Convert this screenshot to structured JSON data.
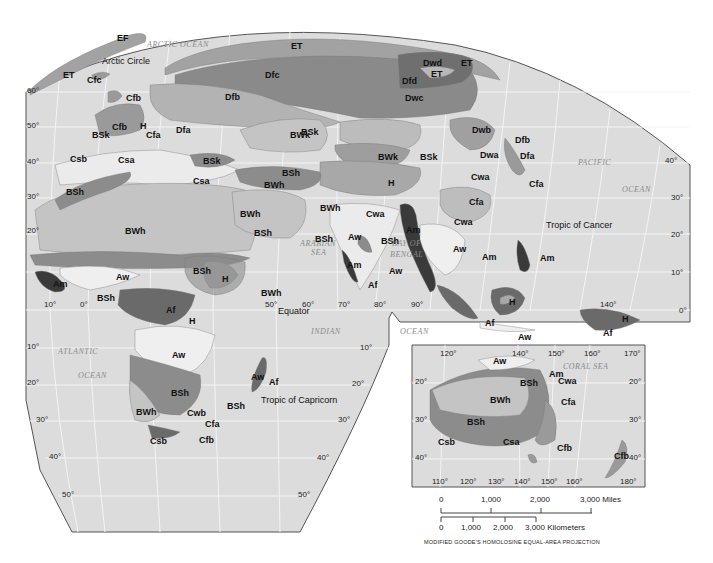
{
  "map": {
    "projection_note": "MODIFIED GOODE'S HOMOLOSINE EQUAL-AREA PROJECTION",
    "colors": {
      "ocean": "#dcdcdc",
      "grid": "#f4f4f4",
      "outline": "#555555",
      "tropical_wet_Af": "#6a6a6a",
      "tropical_monsoon_Am": "#3a3a3a",
      "savanna_Aw": "#efefef",
      "desert_BW": "#c4c4c4",
      "steppe_BS": "#8c8c8c",
      "mediterranean_Cs": "#ebebeb",
      "humid_subtropical_Cfa": "#bdbdbd",
      "marine_Cfb": "#9a9a9a",
      "continental_Dfb": "#b3b3b3",
      "subarctic_Dfc": "#8a8a8a",
      "tundra_ET": "#a2a2a2",
      "highland_H": "#a8a8a8"
    },
    "oceans": [
      {
        "id": "arctic",
        "label": "ARCTIC OCEAN",
        "x": 147,
        "y": 46
      },
      {
        "id": "pacific",
        "label": "PACIFIC",
        "x": 578,
        "y": 164
      },
      {
        "id": "pacific2",
        "label": "OCEAN",
        "x": 622,
        "y": 191
      },
      {
        "id": "arabian",
        "label": "ARABIAN",
        "x": 300,
        "y": 245
      },
      {
        "id": "arabian2",
        "label": "SEA",
        "x": 311,
        "y": 254
      },
      {
        "id": "bengal",
        "label": "BAY OF",
        "x": 392,
        "y": 245
      },
      {
        "id": "bengal2",
        "label": "BENGAL",
        "x": 390,
        "y": 256
      },
      {
        "id": "indian",
        "label": "INDIAN",
        "x": 311,
        "y": 333
      },
      {
        "id": "indian2",
        "label": "OCEAN",
        "x": 400,
        "y": 333
      },
      {
        "id": "atlantic",
        "label": "ATLANTIC",
        "x": 58,
        "y": 353
      },
      {
        "id": "atlantic2",
        "label": "OCEAN",
        "x": 78,
        "y": 377
      },
      {
        "id": "coral",
        "label": "CORAL SEA",
        "x": 563,
        "y": 368
      }
    ],
    "features": [
      {
        "id": "arctic-circle",
        "label": "Arctic Circle",
        "x": 102,
        "y": 62
      },
      {
        "id": "equator",
        "label": "Equator",
        "x": 278,
        "y": 312
      },
      {
        "id": "tropic-cancer",
        "label": "Tropic of Cancer",
        "x": 546,
        "y": 226
      },
      {
        "id": "tropic-capricorn",
        "label": "Tropic of Capricorn",
        "x": 261,
        "y": 401
      }
    ],
    "climate_labels": [
      {
        "t": "EF",
        "x": 117,
        "y": 39
      },
      {
        "t": "ET",
        "x": 63,
        "y": 76
      },
      {
        "t": "Cfc",
        "x": 87,
        "y": 81
      },
      {
        "t": "ET",
        "x": 291,
        "y": 47
      },
      {
        "t": "Dfc",
        "x": 265,
        "y": 76
      },
      {
        "t": "Dwd",
        "x": 423,
        "y": 64
      },
      {
        "t": "ET",
        "x": 461,
        "y": 64
      },
      {
        "t": "ET",
        "x": 431,
        "y": 75
      },
      {
        "t": "Dfd",
        "x": 402,
        "y": 82
      },
      {
        "t": "Dwc",
        "x": 405,
        "y": 99
      },
      {
        "t": "Dfb",
        "x": 225,
        "y": 98
      },
      {
        "t": "Cfb",
        "x": 126,
        "y": 99
      },
      {
        "t": "Cfb",
        "x": 112,
        "y": 128
      },
      {
        "t": "H",
        "x": 140,
        "y": 127
      },
      {
        "t": "Cfa",
        "x": 146,
        "y": 136
      },
      {
        "t": "Dfa",
        "x": 176,
        "y": 131
      },
      {
        "t": "BSk",
        "x": 92,
        "y": 136
      },
      {
        "t": "Csb",
        "x": 70,
        "y": 160
      },
      {
        "t": "Csa",
        "x": 118,
        "y": 161
      },
      {
        "t": "BSk",
        "x": 301,
        "y": 133
      },
      {
        "t": "BWk",
        "x": 290,
        "y": 136
      },
      {
        "t": "BWk",
        "x": 378,
        "y": 158
      },
      {
        "t": "BSk",
        "x": 420,
        "y": 158
      },
      {
        "t": "Dwb",
        "x": 472,
        "y": 131
      },
      {
        "t": "Dfb",
        "x": 515,
        "y": 141
      },
      {
        "t": "Dwa",
        "x": 480,
        "y": 156
      },
      {
        "t": "Dfa",
        "x": 520,
        "y": 157
      },
      {
        "t": "BSk",
        "x": 203,
        "y": 162
      },
      {
        "t": "Csa",
        "x": 193,
        "y": 182
      },
      {
        "t": "BSh",
        "x": 66,
        "y": 193
      },
      {
        "t": "BSh",
        "x": 282,
        "y": 174
      },
      {
        "t": "BWh",
        "x": 264,
        "y": 186
      },
      {
        "t": "H",
        "x": 388,
        "y": 184
      },
      {
        "t": "Cwa",
        "x": 471,
        "y": 178
      },
      {
        "t": "Cfa",
        "x": 529,
        "y": 185
      },
      {
        "t": "Cfa",
        "x": 469,
        "y": 203
      },
      {
        "t": "BWh",
        "x": 240,
        "y": 215
      },
      {
        "t": "BWh",
        "x": 320,
        "y": 209
      },
      {
        "t": "Cwa",
        "x": 366,
        "y": 215
      },
      {
        "t": "Cwa",
        "x": 454,
        "y": 223
      },
      {
        "t": "BWh",
        "x": 125,
        "y": 232
      },
      {
        "t": "BSh",
        "x": 254,
        "y": 234
      },
      {
        "t": "BSh",
        "x": 315,
        "y": 240
      },
      {
        "t": "Aw",
        "x": 348,
        "y": 238
      },
      {
        "t": "BSh",
        "x": 381,
        "y": 242
      },
      {
        "t": "Am",
        "x": 406,
        "y": 231
      },
      {
        "t": "Aw",
        "x": 453,
        "y": 250
      },
      {
        "t": "Am",
        "x": 482,
        "y": 258
      },
      {
        "t": "Am",
        "x": 540,
        "y": 259
      },
      {
        "t": "Am",
        "x": 347,
        "y": 266
      },
      {
        "t": "Aw",
        "x": 389,
        "y": 272
      },
      {
        "t": "Af",
        "x": 368,
        "y": 286
      },
      {
        "t": "BSh",
        "x": 193,
        "y": 272
      },
      {
        "t": "H",
        "x": 222,
        "y": 280
      },
      {
        "t": "Aw",
        "x": 116,
        "y": 278
      },
      {
        "t": "Am",
        "x": 53,
        "y": 285
      },
      {
        "t": "BSh",
        "x": 97,
        "y": 299
      },
      {
        "t": "BWh",
        "x": 261,
        "y": 294
      },
      {
        "t": "Af",
        "x": 166,
        "y": 311
      },
      {
        "t": "H",
        "x": 189,
        "y": 322
      },
      {
        "t": "H",
        "x": 509,
        "y": 303
      },
      {
        "t": "Af",
        "x": 485,
        "y": 324
      },
      {
        "t": "H",
        "x": 622,
        "y": 320
      },
      {
        "t": "Af",
        "x": 603,
        "y": 334
      },
      {
        "t": "Aw",
        "x": 518,
        "y": 338
      },
      {
        "t": "Aw",
        "x": 172,
        "y": 356
      },
      {
        "t": "Aw",
        "x": 251,
        "y": 378
      },
      {
        "t": "Af",
        "x": 269,
        "y": 383
      },
      {
        "t": "BSh",
        "x": 171,
        "y": 394
      },
      {
        "t": "BSh",
        "x": 227,
        "y": 407
      },
      {
        "t": "BWh",
        "x": 136,
        "y": 413
      },
      {
        "t": "Cwb",
        "x": 187,
        "y": 414
      },
      {
        "t": "Cfa",
        "x": 205,
        "y": 425
      },
      {
        "t": "Csb",
        "x": 150,
        "y": 442
      },
      {
        "t": "Cfb",
        "x": 199,
        "y": 441
      },
      {
        "t": "Aw",
        "x": 493,
        "y": 362
      },
      {
        "t": "Am",
        "x": 549,
        "y": 375
      },
      {
        "t": "BSh",
        "x": 520,
        "y": 384
      },
      {
        "t": "Cwa",
        "x": 558,
        "y": 382
      },
      {
        "t": "BWh",
        "x": 490,
        "y": 401
      },
      {
        "t": "Cfa",
        "x": 561,
        "y": 403
      },
      {
        "t": "BSh",
        "x": 467,
        "y": 423
      },
      {
        "t": "Csb",
        "x": 438,
        "y": 443
      },
      {
        "t": "Csa",
        "x": 503,
        "y": 443
      },
      {
        "t": "Cfb",
        "x": 557,
        "y": 449
      },
      {
        "t": "Cfb",
        "x": 614,
        "y": 457
      }
    ],
    "latitude_labels": [
      {
        "t": "60°",
        "x": 27,
        "y": 92
      },
      {
        "t": "50°",
        "x": 27,
        "y": 127
      },
      {
        "t": "40°",
        "x": 27,
        "y": 163
      },
      {
        "t": "30°",
        "x": 27,
        "y": 198
      },
      {
        "t": "20°",
        "x": 27,
        "y": 232
      },
      {
        "t": "10°",
        "x": 27,
        "y": 348
      },
      {
        "t": "20°",
        "x": 27,
        "y": 384
      },
      {
        "t": "30°",
        "x": 36,
        "y": 421
      },
      {
        "t": "40°",
        "x": 49,
        "y": 458
      },
      {
        "t": "50°",
        "x": 62,
        "y": 496
      },
      {
        "t": "40°",
        "x": 665,
        "y": 162
      },
      {
        "t": "30°",
        "x": 671,
        "y": 199
      },
      {
        "t": "20°",
        "x": 671,
        "y": 236
      },
      {
        "t": "10°",
        "x": 671,
        "y": 274
      },
      {
        "t": "0°",
        "x": 679,
        "y": 312
      },
      {
        "t": "10°",
        "x": 360,
        "y": 349
      },
      {
        "t": "20°",
        "x": 352,
        "y": 385
      },
      {
        "t": "30°",
        "x": 338,
        "y": 421
      },
      {
        "t": "40°",
        "x": 317,
        "y": 459
      },
      {
        "t": "50°",
        "x": 298,
        "y": 496
      }
    ],
    "longitude_labels": [
      {
        "t": "10°",
        "x": 44,
        "y": 306
      },
      {
        "t": "0°",
        "x": 80,
        "y": 306
      },
      {
        "t": "50°",
        "x": 265,
        "y": 306
      },
      {
        "t": "60°",
        "x": 302,
        "y": 306
      },
      {
        "t": "70°",
        "x": 338,
        "y": 306
      },
      {
        "t": "80°",
        "x": 374,
        "y": 306
      },
      {
        "t": "90°",
        "x": 411,
        "y": 306
      },
      {
        "t": "140°",
        "x": 600,
        "y": 306
      }
    ],
    "inset": {
      "top_labels": [
        {
          "t": "120°",
          "x": 440,
          "y": 355
        },
        {
          "t": "140°",
          "x": 512,
          "y": 355
        },
        {
          "t": "150°",
          "x": 548,
          "y": 355
        },
        {
          "t": "160°",
          "x": 584,
          "y": 355
        },
        {
          "t": "170°",
          "x": 624,
          "y": 355
        }
      ],
      "bottom_labels": [
        {
          "t": "110°",
          "x": 432,
          "y": 483
        },
        {
          "t": "120°",
          "x": 460,
          "y": 483
        },
        {
          "t": "130°",
          "x": 488,
          "y": 483
        },
        {
          "t": "140°",
          "x": 514,
          "y": 483
        },
        {
          "t": "150°",
          "x": 541,
          "y": 483
        },
        {
          "t": "160°",
          "x": 566,
          "y": 483
        },
        {
          "t": "180°",
          "x": 620,
          "y": 483
        }
      ],
      "left_labels": [
        {
          "t": "20°",
          "x": 415,
          "y": 383
        },
        {
          "t": "30°",
          "x": 415,
          "y": 421
        },
        {
          "t": "40°",
          "x": 415,
          "y": 459
        }
      ],
      "right_labels": [
        {
          "t": "20°",
          "x": 629,
          "y": 383
        },
        {
          "t": "30°",
          "x": 629,
          "y": 421
        },
        {
          "t": "40°",
          "x": 629,
          "y": 459
        }
      ]
    },
    "scale": {
      "miles": {
        "ticks": [
          "0",
          "1,000",
          "2,000",
          "3,000 Miles"
        ]
      },
      "km": {
        "ticks": [
          "0",
          "1,000",
          "2,000",
          "3,000 Kilometers"
        ]
      }
    }
  }
}
